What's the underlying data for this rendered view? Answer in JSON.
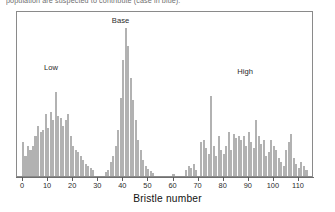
{
  "caption": "population are suspected to contribute (case in blue).",
  "chart_data": {
    "type": "bar",
    "title": "",
    "xlabel": "Bristle number",
    "ylabel": "",
    "xlim": [
      0,
      114
    ],
    "ylim": [
      0,
      166
    ],
    "grid": false,
    "legend_position": "none",
    "bar_color": "#b2b2b2",
    "axis_color": "#6f6f6f",
    "tick_labels": [
      "0",
      "10",
      "20",
      "30",
      "40",
      "50",
      "60",
      "70",
      "80",
      "90",
      "100",
      "110"
    ],
    "tick_values": [
      0,
      10,
      20,
      30,
      40,
      50,
      60,
      70,
      80,
      90,
      100,
      110
    ],
    "annotations": [
      {
        "text": "Low",
        "x": 12,
        "y": 104
      },
      {
        "text": "Base",
        "x": 39,
        "y": 151
      },
      {
        "text": "High",
        "x": 89,
        "y": 100
      }
    ],
    "categories": [
      0,
      1,
      2,
      3,
      4,
      5,
      6,
      7,
      8,
      9,
      10,
      11,
      12,
      13,
      14,
      15,
      16,
      17,
      18,
      19,
      20,
      21,
      22,
      23,
      24,
      25,
      26,
      27,
      28,
      29,
      30,
      31,
      32,
      33,
      34,
      35,
      36,
      37,
      38,
      39,
      40,
      41,
      42,
      43,
      44,
      45,
      46,
      47,
      48,
      49,
      50,
      51,
      52,
      53,
      54,
      55,
      56,
      57,
      58,
      59,
      60,
      61,
      62,
      63,
      64,
      65,
      66,
      67,
      68,
      69,
      70,
      71,
      72,
      73,
      74,
      75,
      76,
      77,
      78,
      79,
      80,
      81,
      82,
      83,
      84,
      85,
      86,
      87,
      88,
      89,
      90,
      91,
      92,
      93,
      94,
      95,
      96,
      97,
      98,
      99,
      100,
      101,
      102,
      103,
      104,
      105,
      106,
      107,
      108,
      109,
      110,
      111,
      112,
      113
    ],
    "values": [
      34,
      20,
      30,
      26,
      30,
      40,
      50,
      44,
      46,
      62,
      48,
      64,
      56,
      84,
      60,
      58,
      50,
      56,
      62,
      40,
      30,
      26,
      24,
      20,
      16,
      12,
      10,
      8,
      6,
      0,
      0,
      0,
      0,
      4,
      6,
      14,
      20,
      30,
      46,
      78,
      116,
      148,
      130,
      98,
      76,
      56,
      36,
      26,
      16,
      10,
      7,
      5,
      3,
      0,
      0,
      0,
      0,
      0,
      0,
      0,
      2,
      0,
      0,
      0,
      0,
      6,
      10,
      8,
      12,
      6,
      0,
      34,
      36,
      28,
      22,
      80,
      30,
      20,
      40,
      26,
      22,
      30,
      44,
      26,
      42,
      38,
      40,
      36,
      40,
      30,
      44,
      34,
      28,
      56,
      40,
      32,
      36,
      20,
      24,
      36,
      30,
      26,
      18,
      14,
      10,
      26,
      34,
      42,
      18,
      12,
      8,
      14,
      10,
      6
    ]
  }
}
